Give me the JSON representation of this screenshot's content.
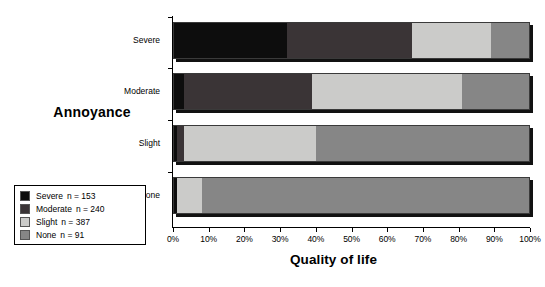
{
  "chart_data": {
    "type": "bar",
    "orientation": "horizontal",
    "stacked": true,
    "stack_mode": "percent",
    "title": "",
    "xlabel": "Quality of life",
    "ylabel": "Annoyance",
    "xlim": [
      0,
      100
    ],
    "xtick_values": [
      0,
      10,
      20,
      30,
      40,
      50,
      60,
      70,
      80,
      90,
      100
    ],
    "xtick_labels": [
      "0%",
      "10%",
      "20%",
      "30%",
      "40%",
      "50%",
      "60%",
      "70%",
      "80%",
      "90%",
      "100%"
    ],
    "grid": false,
    "legend_position": "bottom-left",
    "categories": [
      "Severe",
      "Moderate",
      "Slight",
      "None"
    ],
    "series": [
      {
        "name": "Severe",
        "n": 153,
        "color": "#0d0d0d",
        "values": [
          32,
          3,
          1,
          1
        ]
      },
      {
        "name": "Moderate",
        "n": 240,
        "color": "#3a3436",
        "values": [
          35,
          36,
          2,
          0
        ]
      },
      {
        "name": "Slight",
        "n": 387,
        "color": "#cbcbc9",
        "values": [
          22,
          42,
          37,
          7
        ]
      },
      {
        "name": "None",
        "n": 91,
        "color": "#868686",
        "values": [
          11,
          19,
          60,
          92
        ]
      }
    ],
    "bars": [
      {
        "category": "Severe",
        "segments": [
          {
            "label": "Severe",
            "value": 32,
            "start": 0,
            "end": 32,
            "color": "#0d0d0d"
          },
          {
            "label": "Moderate",
            "value": 35,
            "start": 32,
            "end": 67,
            "color": "#3a3436"
          },
          {
            "label": "Slight",
            "value": 22,
            "start": 67,
            "end": 89,
            "color": "#cbcbc9"
          },
          {
            "label": "None",
            "value": 11,
            "start": 89,
            "end": 100,
            "color": "#868686"
          }
        ]
      },
      {
        "category": "Moderate",
        "segments": [
          {
            "label": "Severe",
            "value": 3,
            "start": 0,
            "end": 3,
            "color": "#0d0d0d"
          },
          {
            "label": "Moderate",
            "value": 36,
            "start": 3,
            "end": 39,
            "color": "#3a3436"
          },
          {
            "label": "Slight",
            "value": 42,
            "start": 39,
            "end": 81,
            "color": "#cbcbc9"
          },
          {
            "label": "None",
            "value": 19,
            "start": 81,
            "end": 100,
            "color": "#868686"
          }
        ]
      },
      {
        "category": "Slight",
        "segments": [
          {
            "label": "Severe",
            "value": 1,
            "start": 0,
            "end": 1,
            "color": "#0d0d0d"
          },
          {
            "label": "Moderate",
            "value": 2,
            "start": 1,
            "end": 3,
            "color": "#3a3436"
          },
          {
            "label": "Slight",
            "value": 37,
            "start": 3,
            "end": 40,
            "color": "#cbcbc9"
          },
          {
            "label": "None",
            "value": 60,
            "start": 40,
            "end": 100,
            "color": "#868686"
          }
        ]
      },
      {
        "category": "None",
        "segments": [
          {
            "label": "Severe",
            "value": 1,
            "start": 0,
            "end": 1,
            "color": "#0d0d0d"
          },
          {
            "label": "Slight",
            "value": 7,
            "start": 1,
            "end": 8,
            "color": "#cbcbc9"
          },
          {
            "label": "None",
            "value": 92,
            "start": 8,
            "end": 100,
            "color": "#868686"
          }
        ]
      }
    ],
    "legend": [
      {
        "label": "Severe",
        "count_text": "n = 153",
        "color": "#0d0d0d"
      },
      {
        "label": "Moderate",
        "count_text": "n = 240",
        "color": "#3a3436"
      },
      {
        "label": "Slight",
        "count_text": "n = 387",
        "color": "#cbcbc9"
      },
      {
        "label": "None",
        "count_text": "n = 91",
        "color": "#868686"
      }
    ]
  },
  "axes": {
    "y_title": "Annoyance",
    "x_title": "Quality of life"
  },
  "colors": {
    "severe": "#0d0d0d",
    "moderate": "#3a3436",
    "slight": "#cbcbc9",
    "none": "#868686",
    "axis": "#000000",
    "background": "#ffffff",
    "shadow": "#111111"
  }
}
